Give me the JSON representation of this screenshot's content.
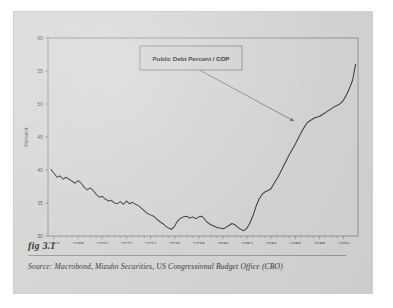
{
  "figure": {
    "label": "fig 3.1",
    "source_prefix": "Source:",
    "source_text": "Macrobond, Mizuho Securities, US Congressional Budget Office (CBO)"
  },
  "annotation": {
    "text": "Public Debt Percent / GDP"
  },
  "colors": {
    "page_background": "#d6d6d4",
    "outer_background": "#ffffff",
    "plot_frame": "#8e8e8c",
    "series_line": "#3a3a38",
    "arrow": "#6f6f6d",
    "tick_text": "#5a5a58",
    "caption_text": "#2c2c2c"
  },
  "chart_data": {
    "type": "line",
    "title": "",
    "subtitle": "",
    "xlabel": "",
    "ylabel": "Percent",
    "xlim": [
      1965.5,
      1991.2
    ],
    "ylim": [
      30,
      60
    ],
    "grid": false,
    "legend_position": "none",
    "yticks": [
      30,
      35,
      40,
      45,
      50,
      55,
      60
    ],
    "ytick_labels": [
      "30",
      "35",
      "40",
      "45",
      "50",
      "55",
      "60"
    ],
    "xticks": [
      1966,
      1968,
      1970,
      1972,
      1974,
      1976,
      1978,
      1980,
      1982,
      1984,
      1986,
      1988,
      1990
    ],
    "xtick_labels": [
      "1966",
      "1968",
      "1970",
      "1972",
      "1974",
      "1976",
      "1978",
      "1980",
      "1982",
      "1984",
      "1986",
      "1988",
      "1990"
    ],
    "xtick_minor_step": 0.5,
    "annotations": [
      {
        "text": "Public Debt Percent / GDP",
        "box": true,
        "arrow_from": [
          1977.6,
          55.6
        ],
        "arrow_to": [
          1985.9,
          47.4
        ]
      }
    ],
    "series": [
      {
        "name": "Public Debt Percent / GDP",
        "x": [
          1965.75,
          1966.0,
          1966.25,
          1966.5,
          1966.75,
          1967.0,
          1967.25,
          1967.5,
          1967.75,
          1968.0,
          1968.25,
          1968.5,
          1968.75,
          1969.0,
          1969.25,
          1969.5,
          1969.75,
          1970.0,
          1970.25,
          1970.5,
          1970.75,
          1971.0,
          1971.25,
          1971.5,
          1971.75,
          1972.0,
          1972.25,
          1972.5,
          1972.75,
          1973.0,
          1973.25,
          1973.5,
          1973.75,
          1974.0,
          1974.25,
          1974.5,
          1974.75,
          1975.0,
          1975.25,
          1975.5,
          1975.75,
          1976.0,
          1976.25,
          1976.5,
          1976.75,
          1977.0,
          1977.25,
          1977.5,
          1977.75,
          1978.0,
          1978.25,
          1978.5,
          1978.75,
          1979.0,
          1979.25,
          1979.5,
          1979.75,
          1980.0,
          1980.25,
          1980.5,
          1980.75,
          1981.0,
          1981.25,
          1981.5,
          1981.75,
          1982.0,
          1982.25,
          1982.5,
          1982.75,
          1983.0,
          1983.25,
          1983.5,
          1983.75,
          1984.0,
          1984.25,
          1984.5,
          1984.75,
          1985.0,
          1985.25,
          1985.5,
          1985.75,
          1986.0,
          1986.25,
          1986.5,
          1986.75,
          1987.0,
          1987.25,
          1987.5,
          1987.75,
          1988.0,
          1988.25,
          1988.5,
          1988.75,
          1989.0,
          1989.25,
          1989.5,
          1989.75,
          1990.0,
          1990.25,
          1990.5,
          1990.75,
          1991.0
        ],
        "values": [
          40.1,
          39.5,
          38.9,
          39.1,
          38.6,
          38.9,
          38.6,
          38.3,
          38.0,
          38.4,
          38.0,
          37.4,
          37.0,
          37.3,
          36.9,
          36.3,
          35.9,
          36.0,
          35.6,
          35.3,
          35.4,
          35.0,
          34.9,
          35.2,
          34.8,
          35.3,
          34.9,
          35.1,
          34.8,
          34.6,
          34.2,
          33.8,
          33.4,
          33.2,
          33.0,
          32.6,
          32.2,
          31.9,
          31.5,
          31.2,
          31.0,
          31.5,
          32.3,
          32.7,
          32.9,
          33.0,
          32.7,
          32.9,
          32.6,
          32.9,
          33.0,
          32.5,
          32.0,
          31.7,
          31.5,
          31.3,
          31.2,
          31.1,
          31.3,
          31.6,
          31.9,
          31.7,
          31.3,
          31.0,
          30.8,
          31.2,
          32.0,
          33.1,
          34.5,
          35.6,
          36.3,
          36.7,
          36.9,
          37.2,
          38.0,
          38.7,
          39.6,
          40.5,
          41.4,
          42.3,
          43.1,
          43.9,
          44.8,
          45.7,
          46.5,
          47.2,
          47.5,
          47.8,
          48.0,
          48.1,
          48.4,
          48.7,
          49.0,
          49.3,
          49.6,
          49.8,
          50.1,
          50.6,
          51.4,
          52.4,
          53.6,
          56.0
        ]
      }
    ]
  }
}
